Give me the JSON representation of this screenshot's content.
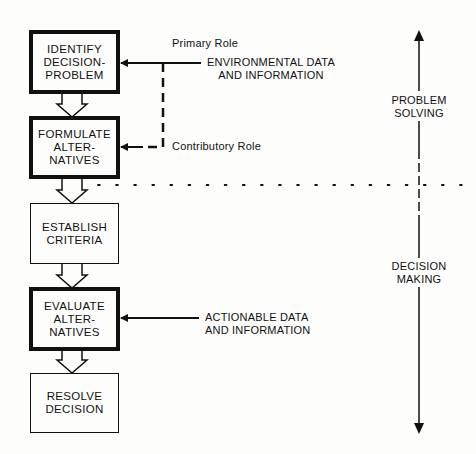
{
  "diagram": {
    "title": "",
    "steps": [
      {
        "id": "identify",
        "label": "IDENTIFY\nDECISION-\nPROBLEM",
        "emphasis": "thick"
      },
      {
        "id": "formulate",
        "label": "FORMULATE\nALTER-\nNATIVES",
        "emphasis": "thick"
      },
      {
        "id": "establish",
        "label": "ESTABLISH\nCRITERIA",
        "emphasis": "thin"
      },
      {
        "id": "evaluate",
        "label": "EVALUATE\nALTER-\nNATIVES",
        "emphasis": "thick"
      },
      {
        "id": "resolve",
        "label": "RESOLVE\nDECISION",
        "emphasis": "thin"
      }
    ],
    "inputs": {
      "environmental": "ENVIRONMENTAL DATA\nAND INFORMATION",
      "actionable": "ACTIONABLE DATA\nAND INFORMATION"
    },
    "roles": {
      "primary": "Primary Role",
      "contributory": "Contributory Role"
    },
    "phases": {
      "problem_solving": "PROBLEM\nSOLVING",
      "decision_making": "DECISION\nMAKING"
    },
    "colors": {
      "ink": "#111111",
      "background": "#fdfdfc"
    }
  }
}
